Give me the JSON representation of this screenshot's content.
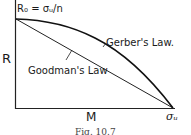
{
  "diagram": {
    "point_label": "R₀ = σᵤ/n",
    "y_axis_label": "R",
    "x_axis_label": "M",
    "x_end_label": "σᵤ",
    "curves": [
      {
        "name": "Gerber's Law.",
        "type": "parabola"
      },
      {
        "name": "Goodman's Law",
        "type": "straight-line"
      }
    ],
    "caption": "Fig. 10.7"
  }
}
